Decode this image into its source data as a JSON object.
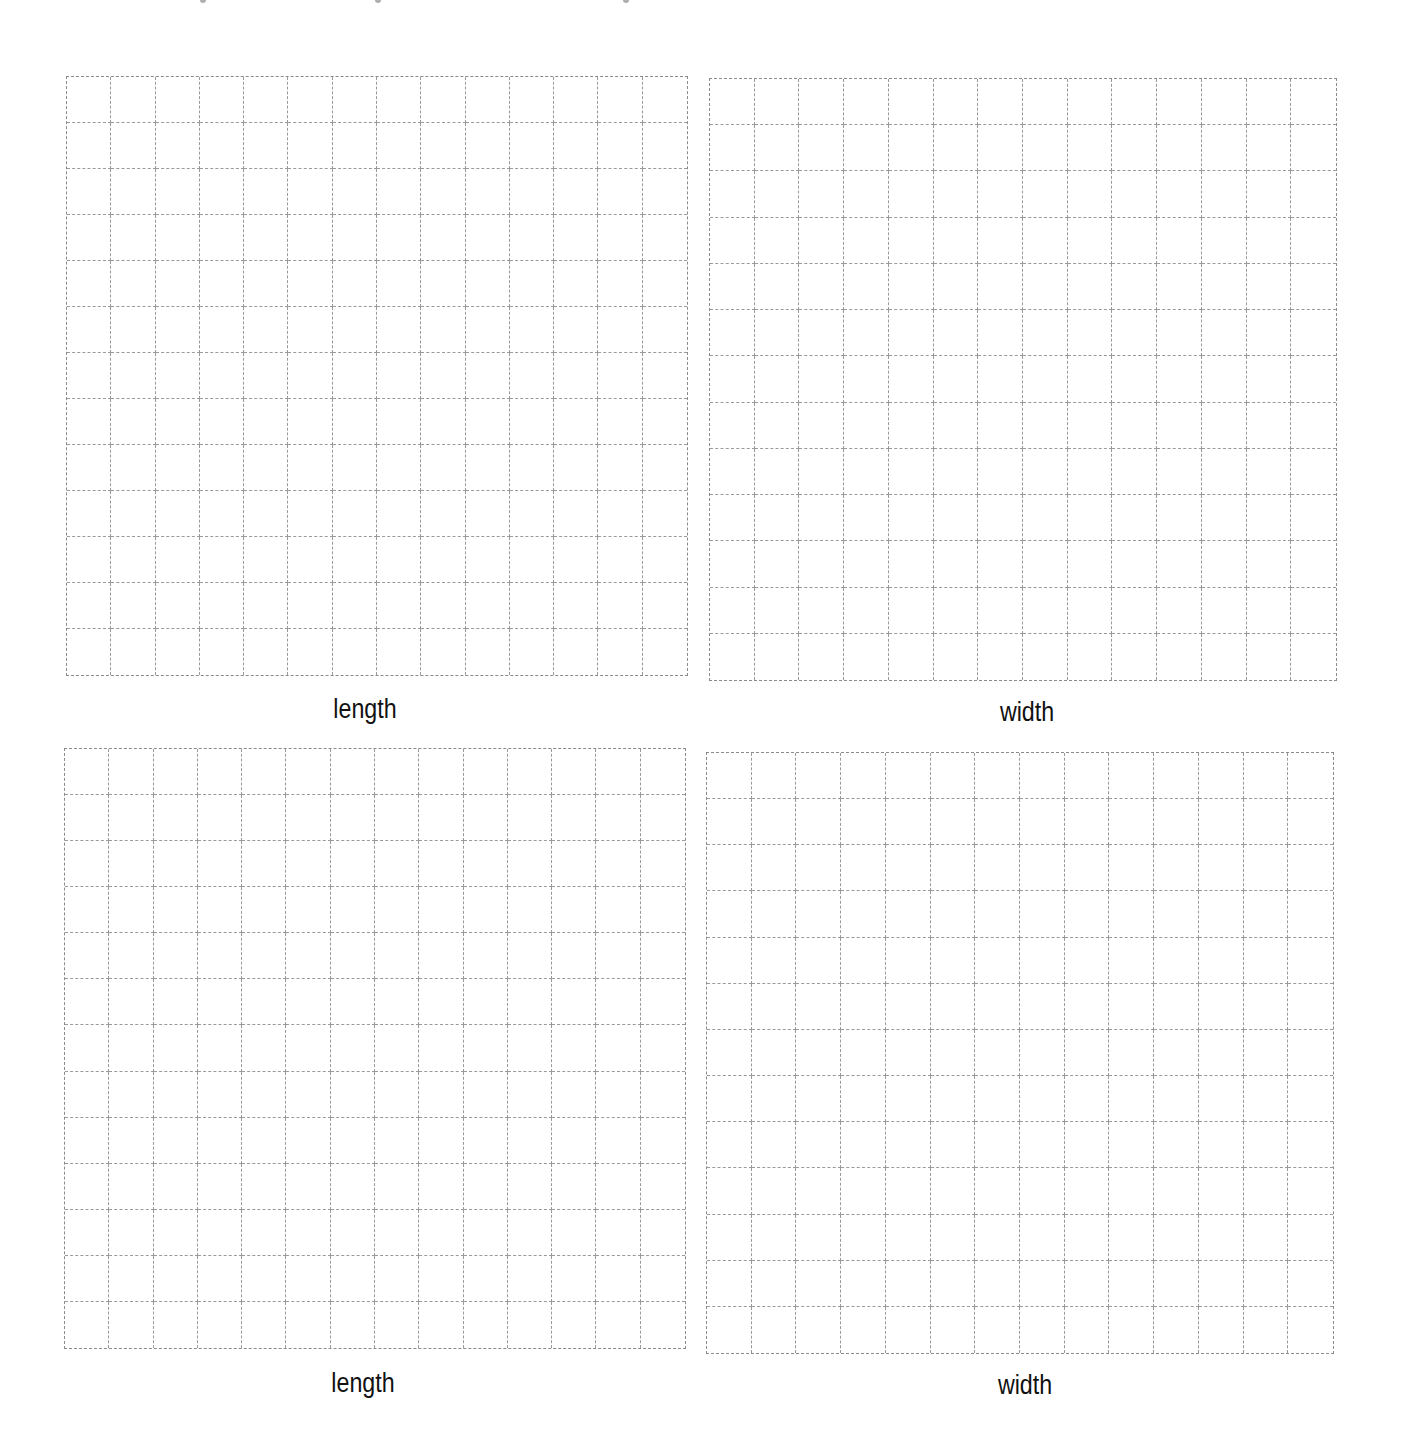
{
  "page": {
    "background": "#ffffff",
    "grid_line_color": "#8a8a8a",
    "label_color": "#111111"
  },
  "clipped_header": {
    "note": "",
    "marks_x": [
      200,
      375,
      623
    ]
  },
  "grids": [
    {
      "id": "grid-top-left",
      "columns": 14,
      "rows": 13,
      "left": 66,
      "top": 76,
      "width": 622,
      "height": 600,
      "label": "length",
      "label_x": 365,
      "label_y": 694
    },
    {
      "id": "grid-top-right",
      "columns": 14,
      "rows": 13,
      "left": 709,
      "top": 78,
      "width": 628,
      "height": 603,
      "label": "width",
      "label_x": 1027,
      "label_y": 697
    },
    {
      "id": "grid-bottom-left",
      "columns": 14,
      "rows": 13,
      "left": 64,
      "top": 748,
      "width": 622,
      "height": 601,
      "label": "length",
      "label_x": 363,
      "label_y": 1368
    },
    {
      "id": "grid-bottom-right",
      "columns": 14,
      "rows": 13,
      "left": 706,
      "top": 752,
      "width": 628,
      "height": 602,
      "label": "width",
      "label_x": 1025,
      "label_y": 1370
    }
  ]
}
